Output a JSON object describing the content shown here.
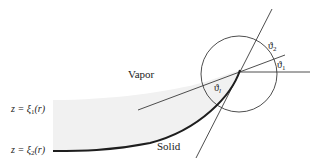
{
  "diagram": {
    "type": "contact-angle-geometry",
    "labels": {
      "vapor": "Vapor",
      "solid": "Solid",
      "upper_surface": {
        "prefix": "z = ξ",
        "sub": "1",
        "suffix": "(r)"
      },
      "lower_surface": {
        "prefix": "z = ξ",
        "sub": "2",
        "suffix": "(r)"
      },
      "theta_1": {
        "base": "ϑ",
        "sub": "1"
      },
      "theta_2": {
        "base": "ϑ",
        "sub": "2"
      },
      "theta_l": {
        "base": "ϑ",
        "sub": "l"
      }
    },
    "colors": {
      "line": "#3a3a3a",
      "solid_curve": "#1e1e1e",
      "liquid_fill": "#f1f1f1",
      "text": "#222222"
    }
  }
}
